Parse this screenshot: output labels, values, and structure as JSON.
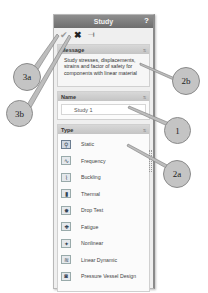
{
  "panel": {
    "title": "Study",
    "help_label": "?",
    "toolbar": {
      "ok_icon": "✔",
      "cancel_icon": "✖",
      "pin_icon": "⟞"
    },
    "message": {
      "header": "Message",
      "text": "Study stresses, displacements, strains and factor of safety for components with linear material"
    },
    "name": {
      "header": "Name",
      "value": "Study 1"
    },
    "type": {
      "header": "Type",
      "selected": "Static",
      "items": [
        {
          "label": "Static",
          "icon": "static-icon"
        },
        {
          "label": "Frequency",
          "icon": "frequency-icon"
        },
        {
          "label": "Buckling",
          "icon": "buckling-icon"
        },
        {
          "label": "Thermal",
          "icon": "thermal-icon"
        },
        {
          "label": "Drop Test",
          "icon": "drop-test-icon"
        },
        {
          "label": "Fatigue",
          "icon": "fatigue-icon"
        },
        {
          "label": "Nonlinear",
          "icon": "nonlinear-icon"
        },
        {
          "label": "Linear Dynamic",
          "icon": "linear-dynamic-icon"
        },
        {
          "label": "Pressure Vessel Design",
          "icon": "pressure-vessel-icon"
        }
      ]
    },
    "collapse_glyph": "≈"
  },
  "callouts": {
    "c3a": "3a",
    "c3b": "3b",
    "c2b": "2b",
    "c1": "1",
    "c2a": "2a"
  },
  "colors": {
    "titlebar": "#7e7e7e",
    "section_header": "#cecece",
    "callout_fill": "#c4c4c4"
  }
}
